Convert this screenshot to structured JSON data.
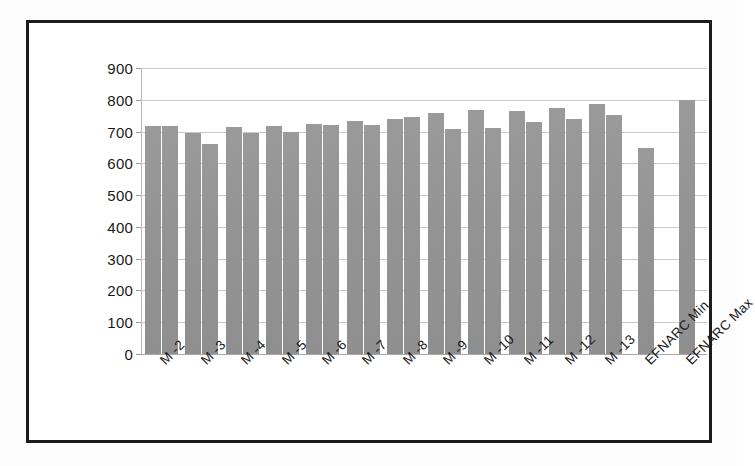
{
  "chart_data": {
    "type": "bar",
    "title": "",
    "subtitle": "",
    "xlabel": "",
    "ylabel": "",
    "ylim": [
      0,
      900
    ],
    "ytick_step": 100,
    "yticks": [
      "900",
      "800",
      "700",
      "600",
      "500",
      "400",
      "300",
      "200",
      "100",
      "0"
    ],
    "grid": true,
    "legend": "none",
    "bar_color": "#969696",
    "frame_color": "#1c1c1c",
    "gridline_color": "#c9c9c9",
    "categories": [
      "M -2",
      "M -3",
      "M -4",
      "M -5",
      "M -6",
      "M -7",
      "M -8",
      "M -9",
      "M -10",
      "M -11",
      "M -12",
      "M -13",
      "EFNARC Min",
      "EFNARC Max"
    ],
    "series": [
      {
        "name": "Series 1",
        "values": [
          718,
          695,
          715,
          718,
          725,
          732,
          738,
          757,
          768,
          765,
          775,
          788,
          648,
          800
        ]
      },
      {
        "name": "Series 2",
        "values": [
          718,
          660,
          695,
          700,
          722,
          722,
          745,
          708,
          712,
          730,
          738,
          752,
          null,
          null
        ]
      }
    ]
  }
}
